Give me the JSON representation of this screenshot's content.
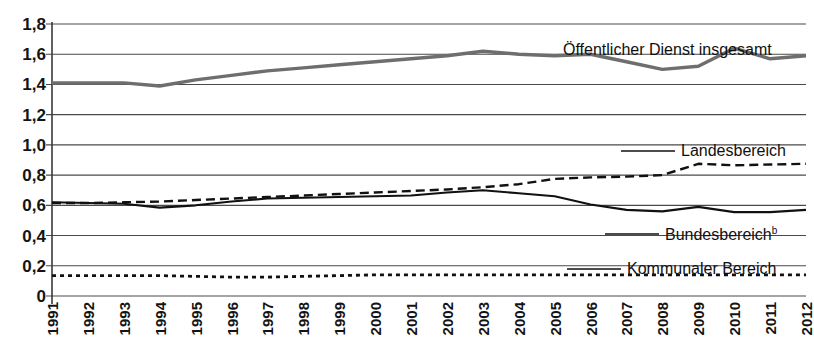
{
  "chart_data": {
    "type": "line",
    "title": "",
    "xlabel": "",
    "ylabel": "",
    "ylim": [
      0,
      1.8
    ],
    "ytick_labels": [
      "1,8",
      "1,6",
      "1,4",
      "1,2",
      "1,0",
      "0,8",
      "0,6",
      "0,4",
      "0,2",
      "0"
    ],
    "ytick_values": [
      1.8,
      1.6,
      1.4,
      1.2,
      1.0,
      0.8,
      0.6,
      0.4,
      0.2,
      0
    ],
    "grid": true,
    "legend_position": "inline-right",
    "categories": [
      "1991",
      "1992",
      "1993",
      "1994",
      "1995",
      "1996",
      "1997",
      "1998",
      "1999",
      "2000",
      "2001",
      "2002",
      "2003",
      "2004",
      "2005",
      "2006",
      "2007",
      "2008",
      "2009",
      "2010",
      "2011",
      "2012"
    ],
    "series": [
      {
        "name": "Öffentlicher Dienst insgesamt",
        "style": "solid-thick-gray",
        "color": "#6e6e6e",
        "values": [
          1.41,
          1.41,
          1.41,
          1.39,
          1.43,
          1.46,
          1.49,
          1.51,
          1.53,
          1.55,
          1.57,
          1.59,
          1.62,
          1.6,
          1.59,
          1.6,
          1.55,
          1.5,
          1.52,
          1.64,
          1.57,
          1.59
        ]
      },
      {
        "name": "Landesbereich",
        "style": "dashed",
        "color": "#111111",
        "values": [
          0.615,
          0.615,
          0.62,
          0.625,
          0.635,
          0.645,
          0.655,
          0.665,
          0.675,
          0.685,
          0.695,
          0.705,
          0.72,
          0.74,
          0.775,
          0.785,
          0.79,
          0.8,
          0.875,
          0.865,
          0.87,
          0.875
        ]
      },
      {
        "name": "Bundesbereich",
        "name_superscript": "b",
        "style": "solid",
        "color": "#111111",
        "values": [
          0.62,
          0.615,
          0.61,
          0.585,
          0.6,
          0.625,
          0.645,
          0.65,
          0.655,
          0.66,
          0.665,
          0.685,
          0.7,
          0.68,
          0.66,
          0.605,
          0.57,
          0.56,
          0.59,
          0.555,
          0.555,
          0.57
        ]
      },
      {
        "name": "Kommunaler Bereich",
        "style": "dotted",
        "color": "#111111",
        "values": [
          0.135,
          0.135,
          0.135,
          0.135,
          0.13,
          0.125,
          0.125,
          0.13,
          0.135,
          0.14,
          0.14,
          0.14,
          0.14,
          0.14,
          0.14,
          0.14,
          0.14,
          0.14,
          0.14,
          0.14,
          0.14,
          0.14
        ]
      }
    ],
    "annotations": [
      {
        "text": "Öffentlicher Dienst insgesamt",
        "leader": false,
        "x": 563,
        "y": 41
      },
      {
        "text": "Landesbereich",
        "leader": true,
        "x": 681,
        "y": 142
      },
      {
        "text": "Bundesbereich",
        "superscript": "b",
        "leader": true,
        "x": 665,
        "y": 225
      },
      {
        "text": "Kommunaler Bereich",
        "leader": true,
        "x": 627,
        "y": 260
      }
    ]
  },
  "plot": {
    "left_px": 52,
    "right_px": 806,
    "top_px": 24,
    "bottom_px": 296
  }
}
